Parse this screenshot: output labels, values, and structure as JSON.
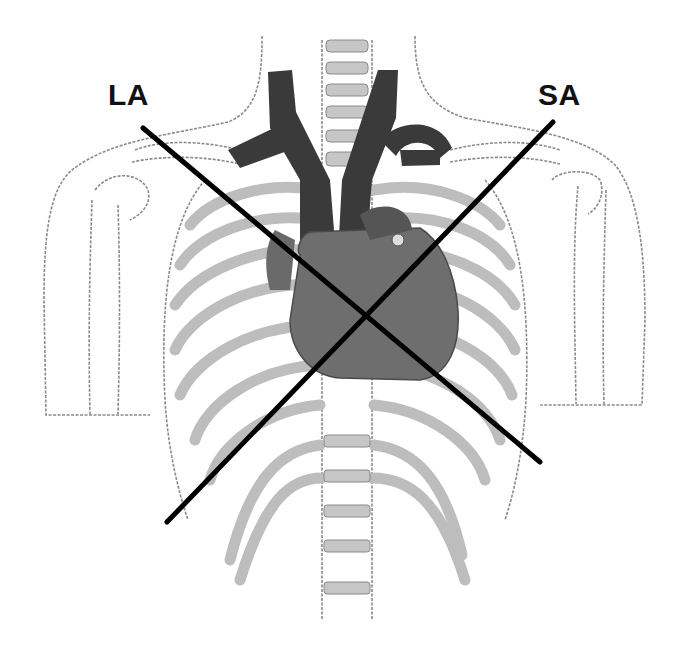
{
  "figure": {
    "labels": {
      "long_axis": "LA",
      "short_axis": "SA"
    },
    "colors": {
      "background": "#ffffff",
      "outline": "#8a8a8a",
      "rib_fill": "#bdbdbd",
      "vessel": "#3a3a3a",
      "heart": "#6e6e6e",
      "axis_line": "#000000"
    },
    "axes": {
      "long_axis": {
        "x1": 143,
        "y1": 128,
        "x2": 540,
        "y2": 462
      },
      "short_axis": {
        "x1": 553,
        "y1": 122,
        "x2": 167,
        "y2": 522
      },
      "intersection": {
        "x": 367,
        "y": 316
      }
    }
  }
}
